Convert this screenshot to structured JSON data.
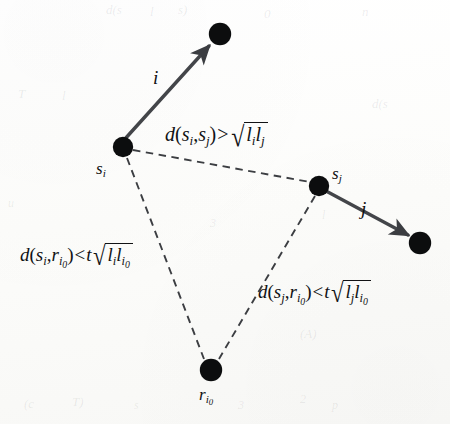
{
  "figure": {
    "type": "diagram",
    "background_color": "#fdfdfc",
    "ink_color": "#111214",
    "dash_color": "#3a3c40"
  },
  "nodes": [
    {
      "id": "arrow-head-i",
      "label": "",
      "cx": 220,
      "cy": 34,
      "r": 11
    },
    {
      "id": "s-i",
      "label": "s",
      "sub": "i",
      "cx": 123,
      "cy": 147,
      "r": 10
    },
    {
      "id": "s-j",
      "label": "s",
      "sub": "j",
      "cx": 319,
      "cy": 186,
      "r": 10
    },
    {
      "id": "arrow-head-j",
      "label": "",
      "cx": 420,
      "cy": 243,
      "r": 11
    },
    {
      "id": "r-i0",
      "label": "r",
      "sub": "i",
      "subsub": "0",
      "cx": 211,
      "cy": 370,
      "r": 11
    }
  ],
  "node_labels": {
    "s_i": {
      "base": "s",
      "sub": "i"
    },
    "s_j": {
      "base": "s",
      "sub": "j"
    },
    "r_i0": {
      "base": "r",
      "sub": "i",
      "subsub": "0"
    }
  },
  "edges": {
    "arrow_i": {
      "label": "i",
      "style": "solid",
      "from": "s-i",
      "to": "arrow-head-i"
    },
    "arrow_j": {
      "label": "j",
      "style": "solid",
      "from": "s-j",
      "to": "arrow-head-j"
    },
    "dashed_si_sj": {
      "style": "dashed",
      "from": "s-i",
      "to": "s-j"
    },
    "dashed_si_ri0": {
      "style": "dashed",
      "from": "s-i",
      "to": "r-i0"
    },
    "dashed_sj_ri0": {
      "style": "dashed",
      "from": "s-j",
      "to": "r-i0"
    }
  },
  "formulas": {
    "top": {
      "id": "d-si-sj",
      "text": "d(s_i, s_j) > sqrt(l_i l_j)",
      "lhs_fn": "d",
      "lhs_open": "(",
      "arg1_base": "s",
      "arg1_sub": "i",
      "comma": ",",
      "arg2_base": "s",
      "arg2_sub": "j",
      "lhs_close": ")",
      "operator": ">",
      "coefficient": "",
      "radicand_1_base": "l",
      "radicand_1_sub": "i",
      "radicand_2_base": "l",
      "radicand_2_sub": "j"
    },
    "left": {
      "id": "d-si-ri0",
      "text": "d(s_i, r_i0) < t sqrt(l_i l_i0)",
      "lhs_fn": "d",
      "lhs_open": "(",
      "arg1_base": "s",
      "arg1_sub": "i",
      "comma": ",",
      "arg2_base": "r",
      "arg2_sub": "i",
      "arg2_subsub": "0",
      "lhs_close": ")",
      "operator": "<",
      "coefficient": "t",
      "radicand_1_base": "l",
      "radicand_1_sub": "i",
      "radicand_2_base": "l",
      "radicand_2_sub": "i",
      "radicand_2_subsub": "0"
    },
    "right": {
      "id": "d-sj-ri0",
      "text": "d(s_j, r_i0) < t sqrt(l_j l_i0)",
      "lhs_fn": "d",
      "lhs_open": "(",
      "arg1_base": "s",
      "arg1_sub": "j",
      "comma": ",",
      "arg2_base": "r",
      "arg2_sub": "i",
      "arg2_subsub": "0",
      "lhs_close": ")",
      "operator": "<",
      "coefficient": "t",
      "radicand_1_base": "l",
      "radicand_1_sub": "j",
      "radicand_2_base": "l",
      "radicand_2_sub": "i",
      "radicand_2_subsub": "0"
    }
  },
  "ghosts": [
    {
      "text": "d(s",
      "x": 106,
      "y": 2,
      "size": 13
    },
    {
      "text": "l",
      "x": 150,
      "y": 4,
      "size": 13
    },
    {
      "text": "s)",
      "x": 178,
      "y": 2,
      "size": 13
    },
    {
      "text": "0",
      "x": 264,
      "y": 6,
      "size": 13
    },
    {
      "text": "n",
      "x": 362,
      "y": 4,
      "size": 13
    },
    {
      "text": "T",
      "x": 18,
      "y": 86,
      "size": 13
    },
    {
      "text": "l",
      "x": 62,
      "y": 88,
      "size": 13
    },
    {
      "text": "d(s",
      "x": 372,
      "y": 96,
      "size": 13
    },
    {
      "text": "u",
      "x": 8,
      "y": 196,
      "size": 12
    },
    {
      "text": "3",
      "x": 210,
      "y": 216,
      "size": 12
    },
    {
      "text": "l",
      "x": 322,
      "y": 208,
      "size": 12
    },
    {
      "text": "(A)",
      "x": 300,
      "y": 326,
      "size": 13
    },
    {
      "text": "(c",
      "x": 24,
      "y": 396,
      "size": 13
    },
    {
      "text": "T)",
      "x": 72,
      "y": 394,
      "size": 13
    },
    {
      "text": "s",
      "x": 134,
      "y": 398,
      "size": 12
    },
    {
      "text": "3",
      "x": 238,
      "y": 398,
      "size": 12
    },
    {
      "text": "2",
      "x": 300,
      "y": 392,
      "size": 12
    },
    {
      "text": "p",
      "x": 332,
      "y": 398,
      "size": 12
    }
  ]
}
